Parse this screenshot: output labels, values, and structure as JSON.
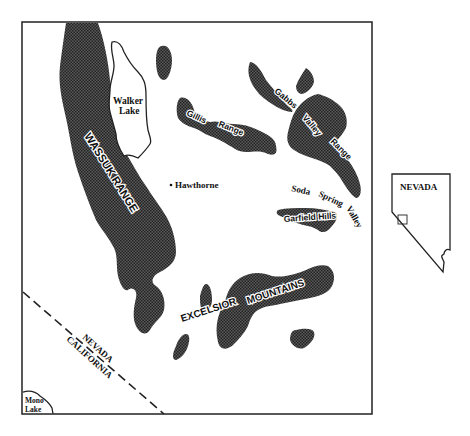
{
  "map": {
    "labels": {
      "walker_lake": [
        "Walker",
        "Lake"
      ],
      "wassuk_range": "WASSUK RANGE",
      "gillis": "Gillis",
      "gillis_range": "Range",
      "gabbs": "Gabbs",
      "valley": "Valley",
      "range": "Range",
      "hawthorne": "Hawthorne",
      "soda": "Soda",
      "spring": "Spring",
      "valley2": "Valley",
      "garfield_hills": "Garfield Hills",
      "excelsior": "EXCELSIOR",
      "mountains": "MOUNTAINS",
      "nevada": "NEVADA",
      "california": "CALIFORNIA",
      "mono_lake": [
        "Mono",
        "Lake"
      ]
    },
    "inset": {
      "state_label": "NEVADA"
    },
    "colors": {
      "frame": "#222222",
      "pattern_dark": "#3a3a3a",
      "background": "#ffffff"
    }
  }
}
